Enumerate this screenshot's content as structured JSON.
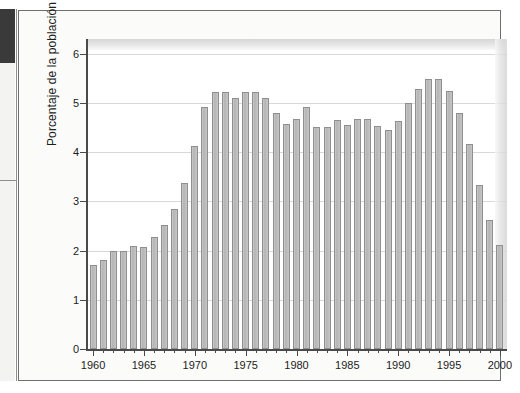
{
  "figure": {
    "ylabel": "Porcentaje de la población",
    "xlabel": "",
    "title": ""
  },
  "axes": {
    "y_ticks": [
      "0",
      "1",
      "2",
      "3",
      "4",
      "5",
      "6"
    ],
    "x_ticks": [
      "1960",
      "1965",
      "1970",
      "1975",
      "1980",
      "1985",
      "1990",
      "1995",
      "2000"
    ]
  },
  "colors": {
    "bar_fill": "#bdbdbd",
    "bar_edge": "#8f8f8f",
    "gridline": "#d8d8d8",
    "axis": "#4a4a4a",
    "plot_background": "#ffffff",
    "figure_background": "#fbfbf9",
    "page_background": "#ffffff",
    "gutter_block": "#3a3a3a",
    "text": "#1c1c1c"
  },
  "chart_data": {
    "type": "bar",
    "title": "",
    "xlabel": "",
    "ylabel": "Porcentaje de la población",
    "xlim": [
      1959.3,
      2000.7
    ],
    "ylim": [
      0,
      6.3
    ],
    "ytick_values": [
      0,
      1,
      2,
      3,
      4,
      5,
      6
    ],
    "xtick_values": [
      1960,
      1965,
      1970,
      1975,
      1980,
      1985,
      1990,
      1995,
      2000
    ],
    "grid": "horizontal",
    "legend": "none",
    "categories": [
      "1960",
      "1961",
      "1962",
      "1963",
      "1964",
      "1965",
      "1966",
      "1967",
      "1968",
      "1969",
      "1970",
      "1971",
      "1972",
      "1973",
      "1974",
      "1975",
      "1976",
      "1977",
      "1978",
      "1979",
      "1980",
      "1981",
      "1982",
      "1983",
      "1984",
      "1985",
      "1986",
      "1987",
      "1988",
      "1989",
      "1990",
      "1991",
      "1992",
      "1993",
      "1994",
      "1995",
      "1996",
      "1997",
      "1998",
      "1999",
      "2000"
    ],
    "values": [
      1.7,
      1.8,
      2.0,
      2.0,
      2.1,
      2.08,
      2.27,
      2.52,
      2.85,
      3.38,
      4.13,
      4.91,
      5.22,
      5.22,
      5.1,
      5.22,
      5.22,
      5.1,
      4.8,
      4.58,
      4.68,
      4.92,
      4.52,
      4.52,
      4.65,
      4.55,
      4.68,
      4.68,
      4.53,
      4.45,
      4.63,
      5.0,
      5.29,
      5.48,
      5.48,
      5.25,
      4.8,
      4.16,
      3.33,
      2.63,
      2.11
    ]
  }
}
